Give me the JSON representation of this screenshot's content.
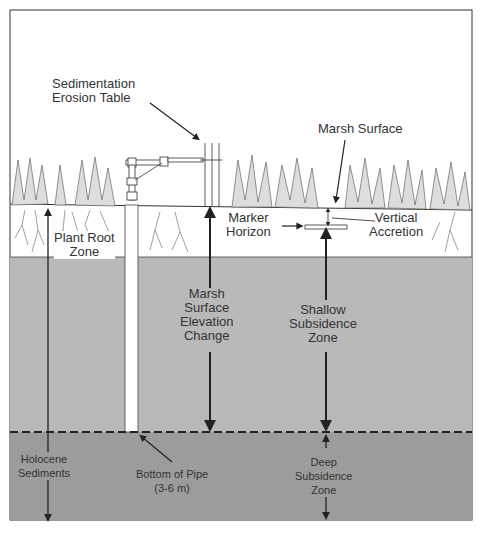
{
  "figure": {
    "labels": {
      "set": [
        "Sedimentation",
        "Erosion Table"
      ],
      "marsh_surface": "Marsh Surface",
      "marker_horizon": [
        "Marker",
        "Horizon"
      ],
      "vertical_accretion": [
        "Vertical",
        "Accretion"
      ],
      "plant_root_zone": [
        "Plant Root",
        "Zone"
      ],
      "marsh_surface_elevation_change": [
        "Marsh",
        "Surface",
        "Elevation",
        "Change"
      ],
      "shallow_subsidence_zone": [
        "Shallow",
        "Subsidence",
        "Zone"
      ],
      "holocene_sediments": [
        "Holocene",
        "Sediments"
      ],
      "bottom_of_pipe": [
        "Bottom of Pipe",
        "(3-6 m)"
      ],
      "deep_subsidence_zone": [
        "Deep",
        "Subsidence",
        "Zone"
      ]
    },
    "colors": {
      "sky": "#ffffff",
      "root_zone": "#ffffff",
      "shallow_sediment": "#b9b9b9",
      "deep_sediment": "#9a9a9a",
      "line": "#222222",
      "text": "#333333"
    }
  }
}
